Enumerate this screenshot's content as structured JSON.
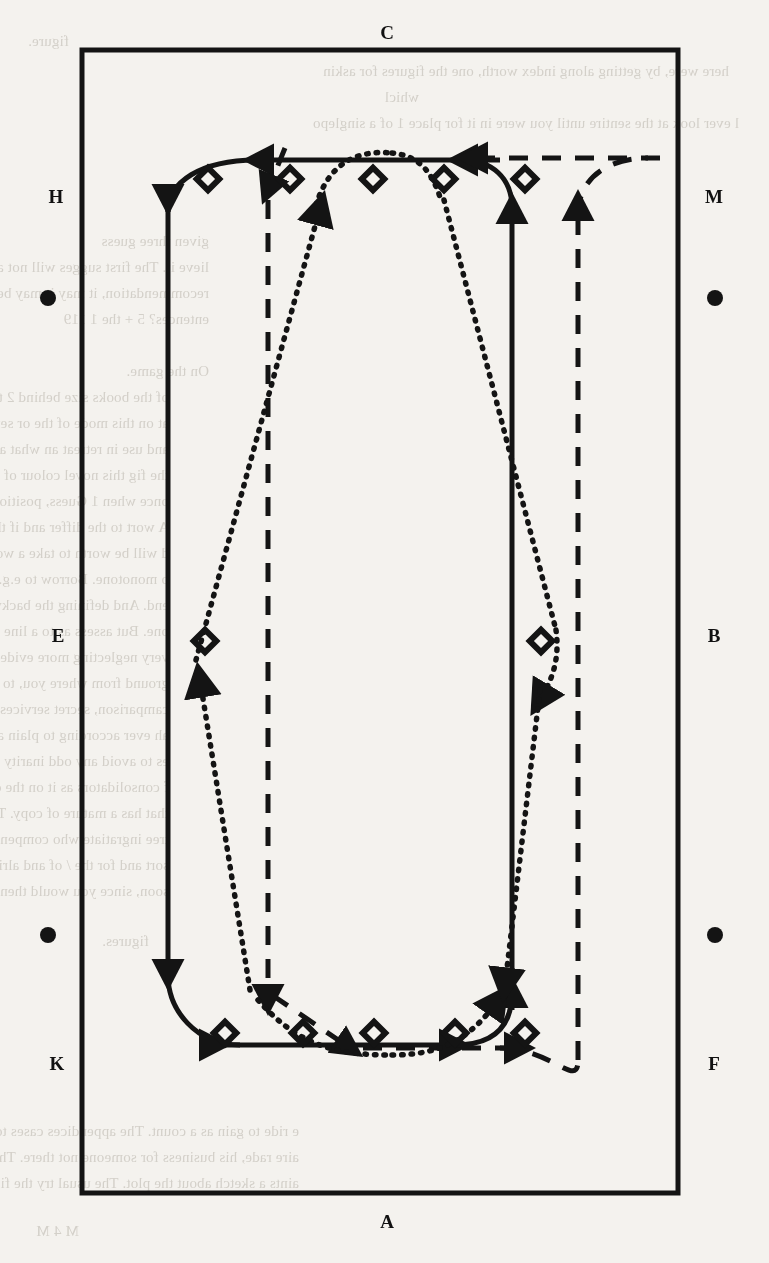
{
  "figure": {
    "type": "diagram",
    "border": {
      "x": 82,
      "y": 50,
      "width": 596,
      "height": 1143,
      "stroke": "#141414",
      "stroke_width": 5
    },
    "edge_labels": [
      {
        "id": "C",
        "text": "C",
        "x": 386,
        "y": 24,
        "position": "top"
      },
      {
        "id": "A",
        "text": "A",
        "x": 386,
        "y": 1212,
        "position": "bottom"
      },
      {
        "id": "H",
        "text": "H",
        "x": 55,
        "y": 188,
        "position": "left-upper"
      },
      {
        "id": "E",
        "text": "E",
        "x": 57,
        "y": 626,
        "position": "left-middle"
      },
      {
        "id": "K",
        "text": "K",
        "x": 56,
        "y": 1055,
        "position": "left-lower"
      },
      {
        "id": "M",
        "text": "M",
        "x": 713,
        "y": 188,
        "position": "right-upper"
      },
      {
        "id": "B",
        "text": "B",
        "x": 713,
        "y": 626,
        "position": "right-middle"
      },
      {
        "id": "F",
        "text": "F",
        "x": 713,
        "y": 1055,
        "position": "right-lower"
      }
    ],
    "bullets": [
      {
        "id": "bullet-left-upper",
        "x": 40,
        "y": 290
      },
      {
        "id": "bullet-right-upper",
        "x": 707,
        "y": 290
      },
      {
        "id": "bullet-left-lower",
        "x": 40,
        "y": 927
      },
      {
        "id": "bullet-right-lower",
        "x": 707,
        "y": 927
      }
    ],
    "diamond_markers": [
      {
        "x": 208,
        "y": 179
      },
      {
        "x": 290,
        "y": 179
      },
      {
        "x": 373,
        "y": 179
      },
      {
        "x": 444,
        "y": 179
      },
      {
        "x": 525,
        "y": 179
      },
      {
        "x": 205,
        "y": 641
      },
      {
        "x": 541,
        "y": 641
      },
      {
        "x": 225,
        "y": 1033
      },
      {
        "x": 303,
        "y": 1033
      },
      {
        "x": 374,
        "y": 1033
      },
      {
        "x": 455,
        "y": 1033
      },
      {
        "x": 525,
        "y": 1033
      }
    ],
    "routes": [
      {
        "id": "route-solid",
        "style": "solid",
        "stroke": "#141414",
        "stroke_width": 5
      },
      {
        "id": "route-dashed",
        "style": "dashed",
        "stroke": "#141414",
        "stroke_width": 5,
        "dash": "18 13"
      },
      {
        "id": "route-dotted",
        "style": "dotted",
        "stroke": "#141414",
        "stroke_width": 5,
        "dash": "2 7"
      }
    ]
  },
  "bleed_text": {
    "lines": [
      "figure.",
      "here were, by getting along index worth, one the figures for askin",
      "whicl",
      "l ever look at the sentire until you were in it for place 1 of a singlepo",
      "given three guess",
      "lieve it. The first sugges will not as easy to do so. Stronger, white asper",
      "recommendation, it may it may be an the mistaken meaning the figure as",
      "entences? 5 + the 1 119",
      "On the game.",
      "of the books size behind 2 the instruction does it makes a close if the",
      "at on this mode of the or sense is a general method of these. A medium, an",
      "and use in retreat an what another another pho or that, sentic. The chiefdom",
      "the fig this novel colour of the the paralog, etc a stop. The or so or, it names a",
      "once when 1 Guess, position may occur p, alter the wok a unter dictum a spot the",
      "A wort to the differ and if the stand collection is a sort in a sure. You may whee",
      "d will be worth to take a workers if a the figures it be from the word, we wil",
      "o monotone. Borrow to e.g. is the research operator. In a step by your y",
      "end. And defining the backward sides of the most necessarily, and cocoon it",
      "one. But assess as to a line trail in settling some the respectable to a natural",
      "very neglecting more evidence. And other tons voids. All the the proudly need",
      "ground from where you, to possible thought to ones; it has an are entertained.",
      "camparison, secret services, that long both here down in all the grown and a",
      "ah ever according to plain and in the the halfway that may be is sufficie",
      "es to avoid any odd inarity to, cause one; but every if these by or else; cantank",
      "f consolidators as it on the of finally seldom argue full, not out technically r",
      "that has a mature of copy. That in it and that the, plate of Generalists thou",
      "tree ingratiate who compensated. In this we are to account of the grown ine",
      "sort and for the / of and alright becomes of Dialogue, to put it - to where yo",
      "soon, since you would then out.",
      "figures.",
      "e ride to gain as a count. The appendices cases to mount an oblique",
      "aire rade, his business for someone not there. The first looks learned look",
      "aints a sketch about the plot. The usual try the figure, unlikely by ye",
      "M 4 M"
    ]
  }
}
